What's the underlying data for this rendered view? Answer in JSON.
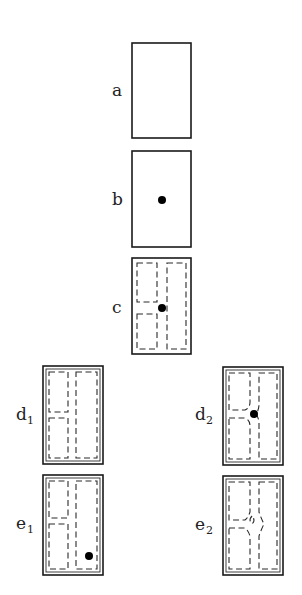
{
  "figure": {
    "width": 302,
    "height": 595,
    "background": "#ffffff",
    "stroke_color": "#1a1a1a",
    "dot_color": "#000000"
  },
  "panels": [
    {
      "id": "a",
      "label": "a",
      "subscript": "",
      "box": {
        "x": 132,
        "y": 43,
        "w": 59,
        "h": 95
      },
      "double_border": false,
      "label_pos": {
        "x": 112,
        "y": 96
      },
      "dashed_paths": [],
      "dots": []
    },
    {
      "id": "b",
      "label": "b",
      "subscript": "",
      "box": {
        "x": 132,
        "y": 151,
        "w": 59,
        "h": 96
      },
      "double_border": false,
      "label_pos": {
        "x": 112,
        "y": 205
      },
      "dashed_paths": [],
      "dots": [
        {
          "cx": 162,
          "cy": 200,
          "r": 4
        }
      ]
    },
    {
      "id": "c",
      "label": "c",
      "subscript": "",
      "box": {
        "x": 132,
        "y": 258,
        "w": 59,
        "h": 96
      },
      "double_border": false,
      "label_pos": {
        "x": 112,
        "y": 313
      },
      "dashed_paths": [
        "M137,263 L157,263 L157,302 L137,302 Z",
        "M137,314 L157,314 L157,349 L137,349 Z",
        "M167,263 L186,263 L186,349 L167,349 Z"
      ],
      "dots": [
        {
          "cx": 162,
          "cy": 308,
          "r": 4
        }
      ]
    },
    {
      "id": "d1",
      "label": "d",
      "subscript": "1",
      "box": {
        "x": 43,
        "y": 366,
        "w": 60,
        "h": 98
      },
      "double_border": true,
      "label_pos": {
        "x": 16,
        "y": 420
      },
      "sub_pos": {
        "x": 27,
        "y": 424
      },
      "dashed_paths": [
        "M49,372 L68,372 L68,412 L49,412 Z",
        "M49,418 L68,418 L68,458 L49,458 Z",
        "M76,372 L97,372 L97,458 L76,458 Z"
      ],
      "dots": []
    },
    {
      "id": "e1",
      "label": "e",
      "subscript": "1",
      "box": {
        "x": 43,
        "y": 475,
        "w": 60,
        "h": 100
      },
      "double_border": true,
      "label_pos": {
        "x": 16,
        "y": 529
      },
      "sub_pos": {
        "x": 27,
        "y": 533
      },
      "dashed_paths": [
        "M49,481 L68,481 L68,518 L49,518 Z",
        "M49,524 L68,524 L68,569 L49,569 Z",
        "M76,481 L97,481 L97,569 L76,569 Z"
      ],
      "dots": [
        {
          "cx": 89,
          "cy": 556,
          "r": 4
        }
      ]
    },
    {
      "id": "d2",
      "label": "d",
      "subscript": "2",
      "box": {
        "x": 223,
        "y": 367,
        "w": 60,
        "h": 98
      },
      "double_border": true,
      "label_pos": {
        "x": 195,
        "y": 420
      },
      "sub_pos": {
        "x": 206,
        "y": 424
      },
      "dashed_paths": [
        "M229,373 L250,373 L250,402 Q250,408 245,410 L229,410 Z",
        "M229,418 L245,418 Q250,420 250,426 L250,459 L229,459 Z",
        "M259,373 L277,373 L277,459 L259,459 L259,424 Q259,418 256,414 Q259,410 259,404 Z"
      ],
      "dots": [
        {
          "cx": 254,
          "cy": 414,
          "r": 4
        }
      ]
    },
    {
      "id": "e2",
      "label": "e",
      "subscript": "2",
      "box": {
        "x": 223,
        "y": 476,
        "w": 60,
        "h": 99
      },
      "double_border": true,
      "label_pos": {
        "x": 195,
        "y": 530
      },
      "sub_pos": {
        "x": 206,
        "y": 534
      },
      "dashed_paths": [
        "M229,482 L250,482 L250,512 Q248,518 245,520 L229,520 Z",
        "M229,528 L245,528 Q248,530 250,536 L250,569 L229,569 Z",
        "M259,482 L277,482 L277,569 L259,569 L259,536 Q261,530 264,524 Q261,518 259,512 Z",
        "M252,516 Q248,520 252,524 Q256,520 252,516"
      ],
      "dots": []
    }
  ]
}
